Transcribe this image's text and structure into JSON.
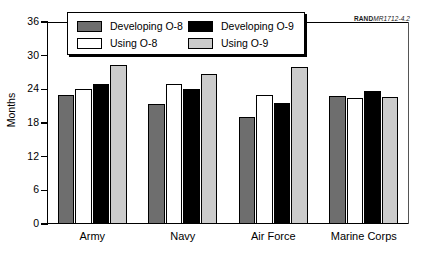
{
  "attribution": {
    "brand": "RAND",
    "document": "MR1712-4.2"
  },
  "chart_data": {
    "type": "bar",
    "title": "",
    "xlabel": "",
    "ylabel": "Months",
    "ylim": [
      0,
      36
    ],
    "yticks": [
      0,
      6,
      12,
      18,
      24,
      30,
      36
    ],
    "ytick_labels": [
      "0",
      "6",
      "12",
      "18",
      "24",
      "30",
      "36"
    ],
    "grid": false,
    "legend_position": "top-center",
    "categories": [
      "Army",
      "Navy",
      "Air Force",
      "Marine Corps"
    ],
    "series": [
      {
        "name": "Developing O-8",
        "color": "#6e6e6e",
        "values": [
          23.0,
          21.3,
          19.0,
          22.8
        ]
      },
      {
        "name": "Using O-8",
        "color": "#ffffff",
        "values": [
          24.0,
          25.0,
          23.0,
          22.5
        ]
      },
      {
        "name": "Developing O-9",
        "color": "#000000",
        "values": [
          25.0,
          24.0,
          21.5,
          23.7
        ]
      },
      {
        "name": "Using O-9",
        "color": "#cbcbcb",
        "values": [
          28.3,
          26.7,
          28.0,
          22.7
        ]
      }
    ]
  }
}
